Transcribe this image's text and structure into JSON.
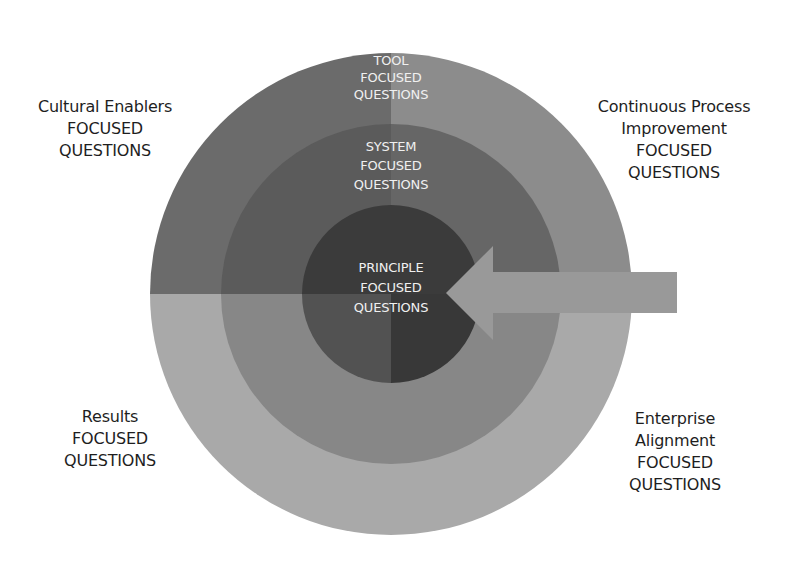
{
  "diagram": {
    "type": "concentric-circles-with-quadrants",
    "center": {
      "x": 391,
      "y": 294
    },
    "rings": [
      {
        "name": "tool",
        "radius": 241,
        "lines": [
          "TOOL",
          "FOCUSED",
          "QUESTIONS"
        ]
      },
      {
        "name": "system",
        "radius": 170,
        "lines": [
          "SYSTEM",
          "FOCUSED",
          "QUESTIONS"
        ]
      },
      {
        "name": "principle",
        "radius": 89,
        "lines": [
          "PRINCIPLE",
          "FOCUSED",
          "QUESTIONS"
        ]
      }
    ],
    "quadrants": {
      "top_left": {
        "lines": [
          "Cultural Enablers",
          "FOCUSED",
          "QUESTIONS"
        ]
      },
      "top_right": {
        "lines": [
          "Continuous Process",
          "Improvement",
          "FOCUSED",
          "QUESTIONS"
        ]
      },
      "bottom_left": {
        "lines": [
          "Results",
          "FOCUSED",
          "QUESTIONS"
        ]
      },
      "bottom_right": {
        "lines": [
          "Enterprise",
          "Alignment",
          "FOCUSED",
          "QUESTIONS"
        ]
      }
    },
    "colors": {
      "outer_top_left": "#6b6b6b",
      "outer_top_right": "#8c8c8c",
      "outer_bottom": "#a9a9a9",
      "middle_top_left": "#5b5b5b",
      "middle_top_right": "#666666",
      "middle_bottom": "#878787",
      "inner_top": "#3b3b3b",
      "inner_bottom_left": "#525252",
      "inner_bottom_right": "#383838",
      "arrow": "#999999",
      "ring_text": "#f0f0f0",
      "corner_text": "#1e1e1e"
    },
    "arrow": {
      "direction": "left",
      "tip_x": 446,
      "shaft_right_x": 677
    }
  }
}
